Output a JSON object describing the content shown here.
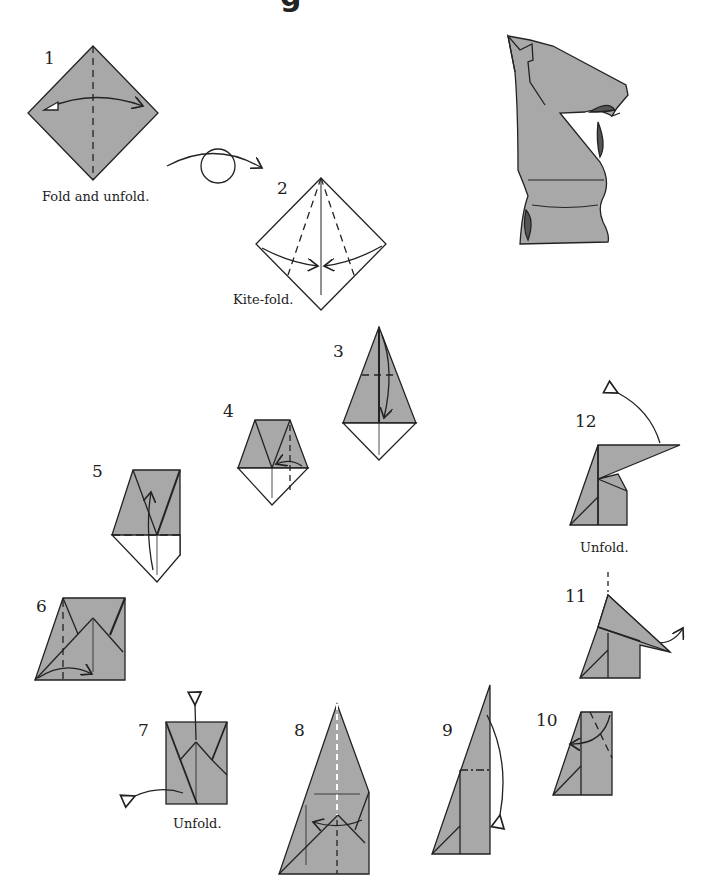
{
  "title_fragment": "g",
  "colors": {
    "paper_gray": "#a8a8a8",
    "shadow_gray": "#555555",
    "line": "#222222"
  },
  "steps": [
    {
      "number": "1",
      "caption": "Fold and unfold."
    },
    {
      "number": "2",
      "caption": "Kite-fold."
    },
    {
      "number": "3",
      "caption": ""
    },
    {
      "number": "4",
      "caption": ""
    },
    {
      "number": "5",
      "caption": ""
    },
    {
      "number": "6",
      "caption": ""
    },
    {
      "number": "7",
      "caption": "Unfold."
    },
    {
      "number": "8",
      "caption": ""
    },
    {
      "number": "9",
      "caption": ""
    },
    {
      "number": "10",
      "caption": ""
    },
    {
      "number": "11",
      "caption": ""
    },
    {
      "number": "12",
      "caption": "Unfold."
    }
  ],
  "final_model": "origami-knight"
}
